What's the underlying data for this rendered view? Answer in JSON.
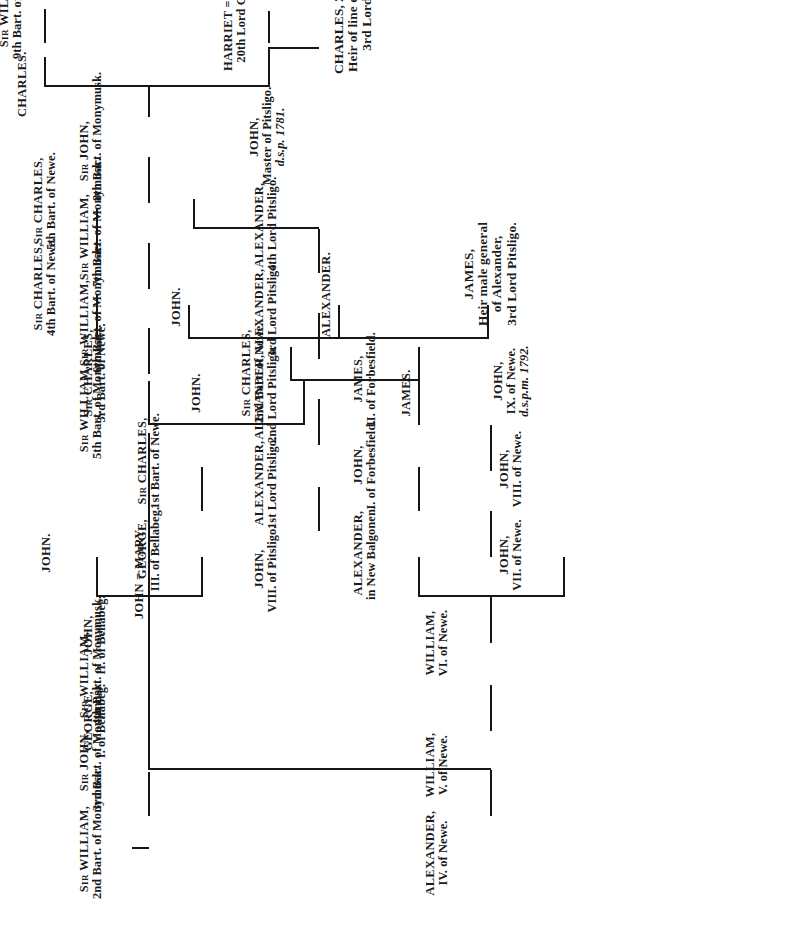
{
  "document": {
    "kind": "genealogical-pedigree-chart",
    "title": "Forbes pedigree chart",
    "orientation": "rotated-90-counterclockwise",
    "ink_color": "#161616",
    "paper_color": "#ffffff"
  },
  "nodes": {
    "monymusk2": {
      "l1": "Sir WILLIAM,",
      "l2": "2nd Bart. of Monymusk."
    },
    "monymusk3": {
      "l1": "Sir JOHN,",
      "l2": "3rd Bart. of Monymusk."
    },
    "monymusk4": {
      "l1": "Sir WILLIAM,",
      "l2": "4th Bart. of Monymusk."
    },
    "john_mary": {
      "l1": "JOHN = MARY."
    },
    "monymusk5": {
      "l1": "Sir WILLIAM,",
      "l2": "5th Bart. of Monymusk."
    },
    "monymusk6": {
      "l1": "Sir WILLIAM,",
      "l2": "6th Bart. of Monymusk."
    },
    "monymusk7": {
      "l1": "Sir WILLIAM,",
      "l2": "7th Bart. of Monymusk."
    },
    "monymusk8": {
      "l1": "Sir JOHN,",
      "l2": "8th Bart. of Monymusk."
    },
    "charles_son": {
      "l1": "CHARLES."
    },
    "monymusk9": {
      "l1": "Sir WILLIAM,",
      "l2": "9th Bart. of Monymusk."
    },
    "harriet_charles": {
      "l1": "HARRIET = CHARLES,",
      "l2": "20th Lord Clinton."
    },
    "charles_clinton21": {
      "l1": "CHARLES, 21st Lord Clinton.",
      "l2": "Heir of line of Alexander,",
      "l3": "3rd Lord Pitsligo."
    },
    "pitsligo_john8": {
      "l1": "JOHN,",
      "l2": "VIII. of Pitsligo."
    },
    "pitsligo_lord1": {
      "l1": "ALEXANDER,",
      "l2": "1st Lord Pitsligo."
    },
    "pitsligo_lord2": {
      "l1": "ALEXANDER,",
      "l2": "2nd Lord Pitsligo."
    },
    "pitsligo_lord3": {
      "l1": "ALEXANDER,",
      "l2": "3rd Lord Pitsligo."
    },
    "pitsligo_lord4": {
      "l1": "ALEXANDER,",
      "l2": "4th Lord Pitsligo."
    },
    "pitsligo_master": {
      "l1": "JOHN,",
      "l2": "Master of Pitsligo.",
      "l3": "d.s.p. 1781."
    },
    "newe4": {
      "l1": "ALEXANDER,",
      "l2": "IV. of Newe."
    },
    "newe5": {
      "l1": "WILLIAM,",
      "l2": "V. of Newe."
    },
    "newe6": {
      "l1": "WILLIAM,",
      "l2": "VI. of Newe."
    },
    "newe7": {
      "l1": "JOHN,",
      "l2": "VII. of Newe."
    },
    "newe8": {
      "l1": "JOHN,",
      "l2": "VIII. of Newe."
    },
    "newe9": {
      "l1": "JOHN,",
      "l2": "IX. of Newe.",
      "l3": "d.s.p.m. 1792."
    },
    "balgonen": {
      "l1": "ALEXANDER,",
      "l2": "in New Balgonen."
    },
    "forbesfield1": {
      "l1": "JOHN,",
      "l2": "I. of Forbesfield."
    },
    "forbesfield2": {
      "l1": "JAMES,",
      "l2": "II. of Forbesfield."
    },
    "bellabeg1": {
      "l1": "GEORGE,",
      "l2": "I. of Bellabeg."
    },
    "bellabeg2": {
      "l1": "JOHN,",
      "l2": "II. of Bellabeg."
    },
    "bellabeg3": {
      "l1": "GEORGE,",
      "l2": "III. of Bellabeg."
    },
    "bellabeg_john": {
      "l1": "JOHN."
    },
    "newe_bart1": {
      "l1": "Sir CHARLES,",
      "l2": "1st Bart. of Newe."
    },
    "newe_bart2": {
      "l1": "Sir CHARLES,",
      "l2": "2nd Bart. of Newe."
    },
    "newe_bart3": {
      "l1": "Sir CHARLES,",
      "l2": "3rd Bart. of Newe."
    },
    "newe_bart4": {
      "l1": "Sir CHARLES,",
      "l2": "4th Bart. of Newe."
    },
    "newe_bart5": {
      "l1": "Sir CHARLES,",
      "l2": "5th Bart. of Newe."
    },
    "john_plain": {
      "l1": "JOHN."
    },
    "james_plain": {
      "l1": "JAMES."
    },
    "alexander_plain": {
      "l1": "ALEXANDER."
    },
    "john_plain2": {
      "l1": "JOHN."
    },
    "james_heir": {
      "l1": "JAMES,",
      "l2": "Heir male general",
      "l3": "of Alexander,",
      "l4": "3rd Lord Pitsligo."
    }
  }
}
